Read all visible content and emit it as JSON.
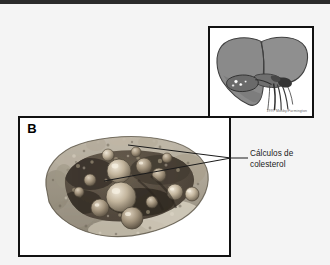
{
  "figure": {
    "background_color": "#f4f4f4",
    "top_rule_color": "#2b2b2b"
  },
  "inset": {
    "name": "liver-and-biliary-tract-schematic",
    "description": "Grayscale anatomical line drawing of the liver with gallbladder containing stones and the biliary vessels",
    "credit": "1997 Mosby/Farmington",
    "border_color": "#111111",
    "liver_fill": "#8f8f8f",
    "liver_shadow": "#6f6f6f",
    "gallbladder_fill": "#6a6a6a",
    "vessel_color": "#3d3d3d",
    "stone_color": "#ffffff"
  },
  "panel_b": {
    "tag": "B",
    "name": "gallbladder-specimen-photograph",
    "description": "Opened gallbladder gross specimen with multiple rounded yellow-tan cholesterol gallstones within the lumen",
    "border_color": "#111111"
  },
  "annotation": {
    "line1": "Cálculos de",
    "line2": "colesterol",
    "color": "#1a1a1a",
    "leader_color": "#1a1a1a"
  }
}
